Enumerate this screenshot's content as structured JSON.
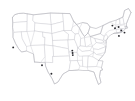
{
  "figure": {
    "kind": "choropleth-base-map",
    "region_label": "United States",
    "width_px": 135,
    "height_px": 101,
    "background_color": "#ffffff",
    "has_title": false,
    "has_legend": false,
    "has_axes": false,
    "has_text_labels": false
  },
  "style": {
    "state_fill_color": "#ffffff",
    "state_border_color": "#c9c9cf",
    "national_outline_color": "#b4b4bb",
    "marker_color": "#2b2b30",
    "state_border_width_px": 0.45,
    "marker_radius_px": 0.95
  },
  "chart_data": {
    "type": "scatter",
    "title": "",
    "subtitle": "",
    "xlabel": "",
    "ylabel": "",
    "grid": false,
    "legend_position": "none",
    "projection": "albers-usa",
    "base_layer": "us-state-boundaries",
    "point_count": 12,
    "points": [
      {
        "id": "p1",
        "x": 13.2,
        "y": 47.4,
        "region": "California Bay Area"
      },
      {
        "id": "p2",
        "x": 42.0,
        "y": 65.2,
        "region": "Arizona / New Mexico"
      },
      {
        "id": "p3",
        "x": 51.4,
        "y": 73.8,
        "region": "South Texas"
      },
      {
        "id": "p4",
        "x": 72.3,
        "y": 50.6,
        "region": "Missouri"
      },
      {
        "id": "p5",
        "x": 72.6,
        "y": 53.0,
        "region": "Missouri / Arkansas"
      },
      {
        "id": "p6",
        "x": 72.8,
        "y": 55.1,
        "region": "Arkansas"
      },
      {
        "id": "p7",
        "x": 112.4,
        "y": 25.6,
        "region": "Upstate New York"
      },
      {
        "id": "p8",
        "x": 115.0,
        "y": 28.2,
        "region": "New York"
      },
      {
        "id": "p9",
        "x": 118.6,
        "y": 27.0,
        "region": "Massachusetts"
      },
      {
        "id": "p10",
        "x": 121.3,
        "y": 30.4,
        "region": "Connecticut / Rhode Island"
      },
      {
        "id": "p11",
        "x": 124.5,
        "y": 32.6,
        "region": "Southern New England"
      },
      {
        "id": "p12",
        "x": 118.9,
        "y": 35.9,
        "region": "New Jersey"
      }
    ],
    "xlim": [
      0,
      135
    ],
    "ylim": [
      0,
      101
    ]
  },
  "states": [
    {
      "code": "WA",
      "name": "Washington"
    },
    {
      "code": "OR",
      "name": "Oregon"
    },
    {
      "code": "CA",
      "name": "California"
    },
    {
      "code": "NV",
      "name": "Nevada"
    },
    {
      "code": "ID",
      "name": "Idaho"
    },
    {
      "code": "MT",
      "name": "Montana"
    },
    {
      "code": "WY",
      "name": "Wyoming"
    },
    {
      "code": "UT",
      "name": "Utah"
    },
    {
      "code": "AZ",
      "name": "Arizona"
    },
    {
      "code": "NM",
      "name": "New Mexico"
    },
    {
      "code": "CO",
      "name": "Colorado"
    },
    {
      "code": "ND",
      "name": "North Dakota"
    },
    {
      "code": "SD",
      "name": "South Dakota"
    },
    {
      "code": "NE",
      "name": "Nebraska"
    },
    {
      "code": "KS",
      "name": "Kansas"
    },
    {
      "code": "OK",
      "name": "Oklahoma"
    },
    {
      "code": "TX",
      "name": "Texas"
    },
    {
      "code": "MN",
      "name": "Minnesota"
    },
    {
      "code": "IA",
      "name": "Iowa"
    },
    {
      "code": "MO",
      "name": "Missouri"
    },
    {
      "code": "AR",
      "name": "Arkansas"
    },
    {
      "code": "LA",
      "name": "Louisiana"
    },
    {
      "code": "WI",
      "name": "Wisconsin"
    },
    {
      "code": "IL",
      "name": "Illinois"
    },
    {
      "code": "MS",
      "name": "Mississippi"
    },
    {
      "code": "MI",
      "name": "Michigan"
    },
    {
      "code": "IN",
      "name": "Indiana"
    },
    {
      "code": "KY",
      "name": "Kentucky"
    },
    {
      "code": "TN",
      "name": "Tennessee"
    },
    {
      "code": "AL",
      "name": "Alabama"
    },
    {
      "code": "OH",
      "name": "Ohio"
    },
    {
      "code": "WV",
      "name": "West Virginia"
    },
    {
      "code": "GA",
      "name": "Georgia"
    },
    {
      "code": "FL",
      "name": "Florida"
    },
    {
      "code": "SC",
      "name": "South Carolina"
    },
    {
      "code": "NC",
      "name": "North Carolina"
    },
    {
      "code": "VA",
      "name": "Virginia"
    },
    {
      "code": "PA",
      "name": "Pennsylvania"
    },
    {
      "code": "NY",
      "name": "New York"
    },
    {
      "code": "MD",
      "name": "Maryland"
    },
    {
      "code": "DE",
      "name": "Delaware"
    },
    {
      "code": "NJ",
      "name": "New Jersey"
    },
    {
      "code": "CT",
      "name": "Connecticut"
    },
    {
      "code": "RI",
      "name": "Rhode Island"
    },
    {
      "code": "MA",
      "name": "Massachusetts"
    },
    {
      "code": "VT",
      "name": "Vermont"
    },
    {
      "code": "NH",
      "name": "New Hampshire"
    },
    {
      "code": "ME",
      "name": "Maine"
    }
  ]
}
